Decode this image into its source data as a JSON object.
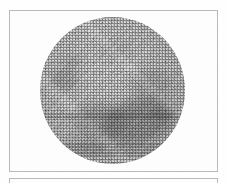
{
  "document": {
    "kind": "scanned-figure-plate",
    "page_background": "#fefefe",
    "rule_color": "#b9b9b9",
    "caption_text": ""
  },
  "figure": {
    "frame": {
      "x": 9,
      "y": 10,
      "width": 209,
      "height": 162,
      "border_color": "#b9b9b9",
      "fill_color": "#fdfdfd"
    },
    "rendering": "halftone-dither-grayscale",
    "disk": {
      "center_x": 111,
      "center_y": 90,
      "radius": 72,
      "base_tone": "#d6d6d6",
      "highlight_tone": "#e4e4e4",
      "limb_tone": "#c4c4c4"
    },
    "surface_features": [
      {
        "name": "mare-lower-right-complex",
        "cx": 108,
        "cy": 110,
        "rx": 37,
        "ry": 22,
        "tone": "#828282",
        "opacity": 0.55,
        "rotation_deg": -14
      },
      {
        "name": "mare-central-lower",
        "cx": 69,
        "cy": 109,
        "rx": 26,
        "ry": 17,
        "tone": "#8e8e8e",
        "opacity": 0.42,
        "rotation_deg": 8
      },
      {
        "name": "mare-right-mid",
        "cx": 121,
        "cy": 74,
        "rx": 20,
        "ry": 16,
        "tone": "#969696",
        "opacity": 0.33,
        "rotation_deg": 0
      },
      {
        "name": "mare-left-mid",
        "cx": 52,
        "cy": 69,
        "rx": 14,
        "ry": 11,
        "tone": "#8c8c8c",
        "opacity": 0.4,
        "rotation_deg": 0
      },
      {
        "name": "patch-upper-left",
        "cx": 61,
        "cy": 51,
        "rx": 10,
        "ry": 7,
        "tone": "#949494",
        "opacity": 0.36,
        "rotation_deg": 0
      },
      {
        "name": "dusky-lower-left",
        "cx": 70,
        "cy": 142,
        "rx": 17,
        "ry": 10,
        "tone": "#9b9b9b",
        "opacity": 0.3,
        "rotation_deg": 0
      },
      {
        "name": "speck-lower-right",
        "cx": 158,
        "cy": 114,
        "rx": 7,
        "ry": 5,
        "tone": "#787878",
        "opacity": 0.45,
        "rotation_deg": 0
      },
      {
        "name": "faint-upper-centre",
        "cx": 94,
        "cy": 41,
        "rx": 17,
        "ry": 9,
        "tone": "#9e9e9e",
        "opacity": 0.22,
        "rotation_deg": 0
      }
    ]
  },
  "next_figure": {
    "frame": {
      "x": 9,
      "y": 178,
      "width": 209,
      "height": 10,
      "border_color": "#b9b9b9",
      "fill_color": "#fdfdfd"
    },
    "note": "top edge of the following plate, clipped by the page bottom"
  }
}
